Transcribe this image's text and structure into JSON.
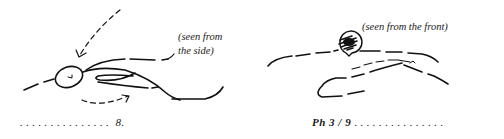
{
  "figures": {
    "side": {
      "caption_line1": "(seen from",
      "caption_line2": "the side)",
      "footer_dots": "...............",
      "footer_label": "8."
    },
    "front": {
      "caption": "(seen from the front)",
      "footer_label": "Ph 3 / 9",
      "footer_dots": " ..............."
    }
  },
  "colors": {
    "ink": "#111111",
    "background": "#ffffff"
  }
}
